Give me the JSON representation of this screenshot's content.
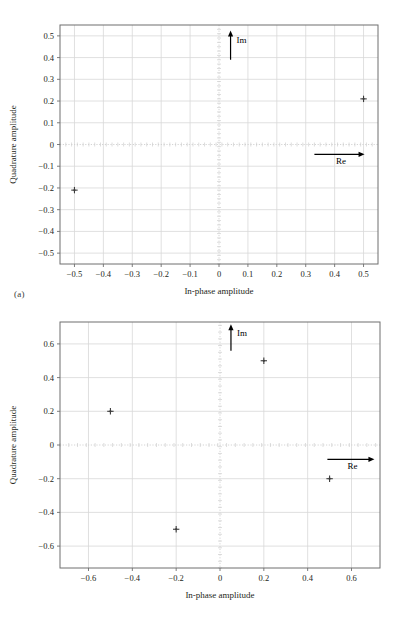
{
  "page": {
    "background_color": "#ffffff",
    "text_color": "#231f20",
    "axis_color": "#6f6f6f",
    "grid_color": "#d8d8d8",
    "zero_line_color": "#cfcfcf",
    "marker_color": "#3c3c3c",
    "annotation_color": "#000000",
    "top_bleed_text": ""
  },
  "figures": [
    {
      "caption": "(a)",
      "chart_data": {
        "type": "scatter",
        "title": "",
        "subtitle": "",
        "xlabel": "In-phase amplitude",
        "ylabel": "Quadrature amplitude",
        "xlim": [
          -0.55,
          0.55
        ],
        "ylim": [
          -0.55,
          0.55
        ],
        "xticks": [
          -0.5,
          -0.4,
          -0.3,
          -0.2,
          -0.1,
          0,
          0.1,
          0.2,
          0.3,
          0.4,
          0.5
        ],
        "yticks": [
          -0.5,
          -0.4,
          -0.3,
          -0.2,
          -0.1,
          0,
          0.1,
          0.2,
          0.3,
          0.4,
          0.5
        ],
        "xticklabels": [
          "−0.5",
          "−0.4",
          "−0.3",
          "−0.2",
          "−0.1",
          "0",
          "0.1",
          "0.2",
          "0.3",
          "0.4",
          "0.5"
        ],
        "yticklabels": [
          "−0.5",
          "−0.4",
          "−0.3",
          "−0.2",
          "−0.1",
          "0",
          "0.1",
          "0.2",
          "0.3",
          "0.4",
          "0.5"
        ],
        "grid": true,
        "legend": null,
        "legend_position": "none",
        "marker": "plus",
        "points": [
          {
            "x": 0.5,
            "y": 0.21
          },
          {
            "x": -0.5,
            "y": -0.21
          }
        ],
        "annotations": [
          {
            "label": "Im",
            "type": "arrow",
            "direction": "up",
            "x": 0.04,
            "y_from": 0.39,
            "y_to": 0.52
          },
          {
            "label": "Re",
            "type": "arrow",
            "direction": "right",
            "y": -0.045,
            "x_from": 0.33,
            "x_to": 0.5
          }
        ]
      }
    },
    {
      "caption": "(b)",
      "chart_data": {
        "type": "scatter",
        "title": "",
        "subtitle": "",
        "xlabel": "In-phase amplitude",
        "ylabel": "Quadrature amplitude",
        "xlim": [
          -0.73,
          0.73
        ],
        "ylim": [
          -0.73,
          0.73
        ],
        "xticks": [
          -0.6,
          -0.4,
          -0.2,
          0,
          0.2,
          0.4,
          0.6
        ],
        "yticks": [
          -0.6,
          -0.4,
          -0.2,
          0,
          0.2,
          0.4,
          0.6
        ],
        "xticklabels": [
          "−0.6",
          "−0.4",
          "−0.2",
          "0",
          "0.2",
          "0.4",
          "0.6"
        ],
        "yticklabels": [
          "−0.6",
          "−0.4",
          "−0.2",
          "0",
          "0.2",
          "0.4",
          "0.6"
        ],
        "grid": true,
        "legend": null,
        "legend_position": "none",
        "marker": "plus",
        "points": [
          {
            "x": -0.5,
            "y": 0.2
          },
          {
            "x": 0.2,
            "y": 0.5
          },
          {
            "x": 0.5,
            "y": -0.2
          },
          {
            "x": -0.2,
            "y": -0.5
          }
        ],
        "annotations": [
          {
            "label": "Im",
            "type": "arrow",
            "direction": "up",
            "x": 0.05,
            "y_from": 0.56,
            "y_to": 0.71
          },
          {
            "label": "Re",
            "type": "arrow",
            "direction": "right",
            "y": -0.085,
            "x_from": 0.49,
            "x_to": 0.7
          }
        ]
      }
    }
  ]
}
